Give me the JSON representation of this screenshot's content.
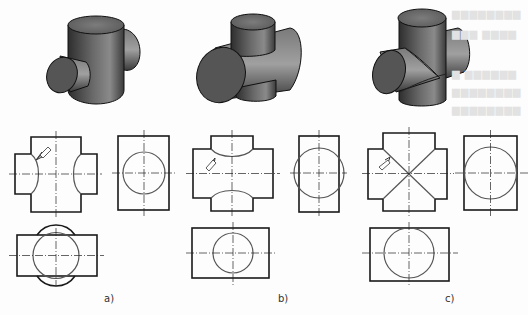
{
  "figure": {
    "panels": [
      {
        "id": "a",
        "label": "a)",
        "description": "Horizontal cylinder diameter smaller than vertical cylinder diameter; intersection curves bend toward the larger cylinder axis",
        "views": [
          "isometric",
          "front-view",
          "side-view",
          "top-view"
        ]
      },
      {
        "id": "b",
        "label": "b)",
        "description": "Horizontal cylinder diameter larger than vertical cylinder diameter; intersection curves bend toward the vertical axis",
        "views": [
          "isometric",
          "front-view",
          "side-view",
          "top-view"
        ]
      },
      {
        "id": "c",
        "label": "c)",
        "description": "Equal diameters; intersection curves project as straight crossing lines",
        "views": [
          "isometric",
          "front-view",
          "side-view",
          "top-view"
        ]
      }
    ],
    "colors": {
      "outline": "#1a1a1a",
      "curve": "#555555",
      "centerline": "#222222",
      "solid_dark": "#3a3a3a",
      "solid_light": "#9a9a9a"
    }
  }
}
